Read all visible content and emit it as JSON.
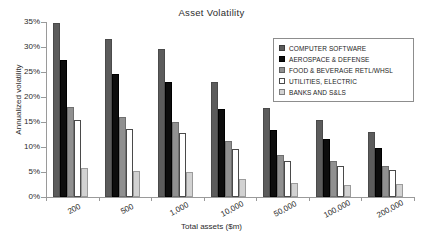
{
  "chart_data": {
    "type": "bar",
    "title": "Asset Volatility",
    "xlabel": "Total assets ($m)",
    "ylabel": "Annualized volatility",
    "categories": [
      "200",
      "500",
      "1,000",
      "10,000",
      "50,000",
      "100,000",
      "200,000"
    ],
    "series": [
      {
        "name": "COMPUTER SOFTWARE",
        "values": [
          34.8,
          31.7,
          29.6,
          23.1,
          17.8,
          15.5,
          13.1
        ],
        "color": "#5c5c5c"
      },
      {
        "name": "AEROSPACE & DEFENSE",
        "values": [
          27.5,
          24.7,
          23.0,
          17.7,
          13.4,
          11.7,
          9.9
        ],
        "color": "#0d0d0d"
      },
      {
        "name": "FOOD & BEVERAGE RETL/WHSL",
        "values": [
          18.0,
          16.0,
          15.0,
          11.2,
          8.5,
          7.3,
          6.2
        ],
        "color": "#909090"
      },
      {
        "name": "UTILITIES, ELECTRIC",
        "values": [
          15.5,
          13.7,
          12.9,
          9.7,
          7.2,
          6.3,
          5.4
        ],
        "color": "#ffffff"
      },
      {
        "name": "BANKS AND S&LS",
        "values": [
          5.9,
          5.3,
          5.0,
          3.7,
          2.9,
          2.5,
          2.7
        ],
        "color": "#d2d2d2"
      }
    ],
    "ylim": [
      0,
      35
    ],
    "yticks": [
      "0%",
      "5%",
      "10%",
      "15%",
      "20%",
      "25%",
      "30%",
      "35%"
    ],
    "ytick_values": [
      0,
      5,
      10,
      15,
      20,
      25,
      30,
      35
    ],
    "grid": false,
    "legend_position": "top-right",
    "y_unit": "percent"
  }
}
